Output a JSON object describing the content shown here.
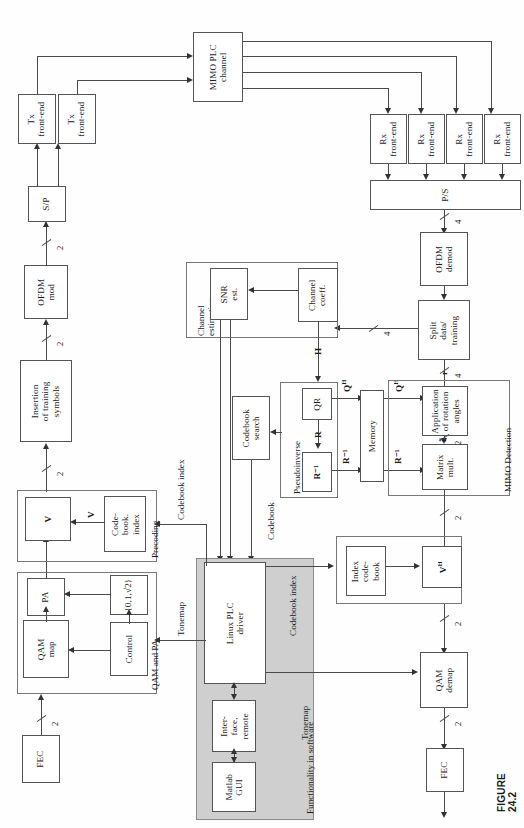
{
  "figure": {
    "caption": "FIGURE 24.2",
    "orientation": "rotated-90-ccw"
  },
  "blocks": {
    "fec_tx": "FEC",
    "qam_map": "QAM\nmap",
    "pa": "PA",
    "control": "Control",
    "levels": "{0,1,√2}",
    "qam_and_pa_group": "QAM and PA",
    "v": "V",
    "codebook_index": "Code-\nbook.\nindex",
    "precoding_group": "Precoding",
    "insertion": "Insertion\nof training\nsymbols",
    "ofdm_mod": "OFDM\nmod",
    "sp": "S/P",
    "tx_front_end_1": "Tx\nfront-end",
    "tx_front_end_2": "Tx\nfront-end",
    "mimo_plc_channel": "MIMO PLC\nchannel",
    "rx_front_end_1": "Rx\nfront-end",
    "rx_front_end_2": "Rx\nfront-end",
    "rx_front_end_3": "Rx\nfront-end",
    "rx_front_end_4": "Rx\nfront-end",
    "ps": "P/S",
    "ofdm_demod": "OFDM\ndemod",
    "split": "Split\ndata/\ntraining",
    "channel_coeff": "Channel\ncoeff.",
    "snr_est": "SNR\nest.",
    "channel_estimation_group": "Channel\nestimation",
    "qr": "QR",
    "r_inv": "R⁻¹",
    "pseudoinverse_group": "Pseudoinverse",
    "codebook_search": "Codebook\nsearch",
    "memory": "Memory",
    "application_rotation": "Application\nof rotation\nangles",
    "matrix_mult": "Matrix\nmult.",
    "mimo_detection_group": "MIMO Detection",
    "index_codebook": "Index\ncode-\nbook",
    "vh": "Vᴴ",
    "qam_demap": "QAM\ndemap",
    "fec_rx": "FEC",
    "linux_plc_driver": "Linux PLC\ndriver",
    "interface_remote": "Inter-\nface,\nremote",
    "matlab_gui": "Matlab\nGUI",
    "functionality_group": "Functionality in software"
  },
  "signal_labels": {
    "h_matrix": "H",
    "q_h_1": "Qᴴ",
    "q_h_2": "Qᴴ",
    "r": "R",
    "r_inv_1": "R⁻¹",
    "r_inv_2": "R⁻¹",
    "v_signal": "V",
    "r_vector": "r",
    "r_tilde": "r̃",
    "codebook_index_bus_left": "Codebook index",
    "codebook_index_bus_right": "Codebook index",
    "codebook_bus_top": "Codebook",
    "tonemap_left": "Tonemap",
    "tonemap_right": "Tonemap"
  },
  "bus_multiplicities": {
    "fec_to_qam": "2",
    "precode_to_insertion": "2",
    "insertion_to_ofdm": "2",
    "ofdm_to_sp": "2",
    "ps_to_ofdmdemod": "4",
    "ofdmdemod_to_split": "4",
    "split_to_rotation": "4",
    "rotation_to_matmult": "2",
    "matmult_to_vh": "2",
    "vh_to_qamdemap": "2",
    "qamdemap_to_fec": "2"
  },
  "colors": {
    "shade_fill": "#cfcfcf",
    "line": "#4a4a4a",
    "block_border": "#555555",
    "page_bg": "#ffffff"
  }
}
